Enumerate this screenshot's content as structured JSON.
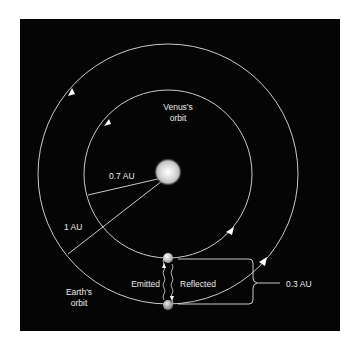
{
  "diagram": {
    "background": "#050505",
    "line_color": "#e0e0e0",
    "labels": {
      "venus_orbit_line1": "Venus's",
      "venus_orbit_line2": "orbit",
      "earth_orbit_line1": "Earth's",
      "earth_orbit_line2": "orbit",
      "venus_radius": "0.7 AU",
      "earth_radius": "1 AU",
      "gap_distance": "0.3 AU",
      "emitted": "Emitted",
      "reflected": "Reflected"
    }
  }
}
